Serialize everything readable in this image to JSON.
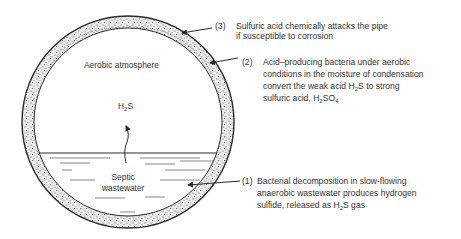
{
  "diagram": {
    "type": "sewer pipe cross-section (crown corrosion mechanism)",
    "inside_labels": {
      "atmosphere": "Aerobic atmosphere",
      "gas_prefix": "H",
      "gas_sub": "2",
      "gas_suffix": "S",
      "water_line1": "Septic",
      "water_line2": "wastewater"
    },
    "annotations": [
      {
        "number": "(3)",
        "lines": [
          "Sulfuric acid chemically attacks the pipe",
          "if susceptible to corrosion"
        ]
      },
      {
        "number": "(2)",
        "lines": [
          "Acid–producing bacteria under aerobic",
          "conditions in the moisture of condensation",
          "convert the weak acid H",
          "2",
          "S to strong",
          "sulfuric acid, H",
          "2",
          "SO",
          "4"
        ]
      },
      {
        "number": "(1)",
        "lines": [
          "Bacterial decomposition in slow-flowing",
          "anaerobic wastewater produces hydrogen",
          "sulfide, released as H",
          "2",
          "S gas"
        ]
      }
    ],
    "colors": {
      "ink": "#2a2a2a",
      "background": "#ffffff",
      "ring_fill": "#e9e9e9"
    }
  }
}
